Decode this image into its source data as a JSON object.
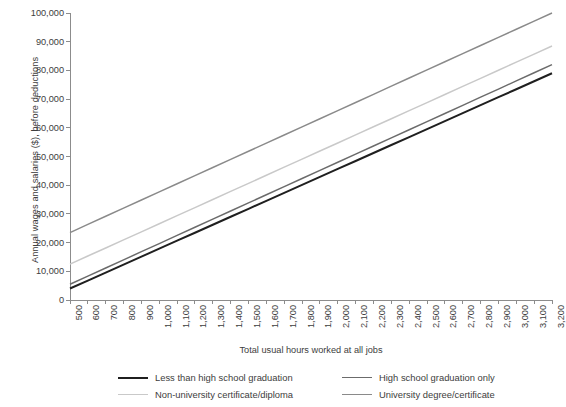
{
  "chart_data": {
    "type": "line",
    "title": "",
    "xlabel": "Total usual hours worked at all jobs",
    "ylabel": "Annual wages and salaries ($), before deductions",
    "xlim": [
      500,
      3200
    ],
    "ylim": [
      0,
      100000
    ],
    "grid": false,
    "legend_position": "bottom",
    "x": [
      500,
      600,
      700,
      800,
      900,
      1000,
      1100,
      1200,
      1300,
      1400,
      1500,
      1600,
      1700,
      1800,
      1900,
      2000,
      2100,
      2200,
      2300,
      2400,
      2500,
      2600,
      2700,
      2800,
      2900,
      3000,
      3100,
      3200
    ],
    "xtick_labels": [
      "500",
      "600",
      "700",
      "800",
      "900",
      "1,000",
      "1,100",
      "1,200",
      "1,300",
      "1,400",
      "1,500",
      "1,600",
      "1,700",
      "1,800",
      "1,900",
      "2,000",
      "2,100",
      "2,200",
      "2,300",
      "2,400",
      "2,500",
      "2,600",
      "2,700",
      "2,800",
      "2,900",
      "3,000",
      "3,100",
      "3,200"
    ],
    "ytick_values": [
      0,
      10000,
      20000,
      30000,
      40000,
      50000,
      60000,
      70000,
      80000,
      90000,
      100000
    ],
    "ytick_labels": [
      "0",
      "10,000",
      "20,000",
      "30,000",
      "40,000",
      "50,000",
      "60,000",
      "70,000",
      "80,000",
      "90,000",
      "100,000"
    ],
    "series": [
      {
        "name": "Less than high school graduation",
        "color": "#1f1f1f",
        "values": [
          4000,
          6778,
          9556,
          12333,
          15111,
          17889,
          20667,
          23444,
          26222,
          29000,
          31778,
          34556,
          37333,
          40111,
          42889,
          45667,
          48444,
          51222,
          54000,
          56778,
          59556,
          62333,
          65111,
          67889,
          70667,
          73444,
          76222,
          79000
        ]
      },
      {
        "name": "High school graduation only",
        "color": "#6b6b6b",
        "values": [
          5500,
          8333,
          11167,
          14000,
          16833,
          19667,
          22500,
          25333,
          28167,
          31000,
          33833,
          36667,
          39500,
          42333,
          45167,
          48000,
          50833,
          53667,
          56500,
          59333,
          62167,
          65000,
          67833,
          70667,
          73500,
          76333,
          79167,
          82000
        ]
      },
      {
        "name": "Non-university certificate/diploma",
        "color": "#c9c9c9",
        "values": [
          12500,
          15315,
          18130,
          20944,
          23759,
          26574,
          29389,
          32204,
          35019,
          37833,
          40648,
          43463,
          46278,
          49093,
          51907,
          54722,
          57537,
          60352,
          63167,
          65981,
          68796,
          71611,
          74426,
          77241,
          80056,
          82870,
          85685,
          88500
        ]
      },
      {
        "name": "University degree/certificate",
        "color": "#8a8a8a",
        "values": [
          23500,
          26333,
          29167,
          32000,
          34833,
          37667,
          40500,
          43333,
          46167,
          49000,
          51833,
          54667,
          57500,
          60333,
          63167,
          66000,
          68833,
          71667,
          74500,
          77333,
          80167,
          83000,
          85833,
          88667,
          91500,
          94333,
          97167,
          100000
        ]
      }
    ]
  },
  "axis": {
    "line_color": "#8c8c8c",
    "tick_color": "#8c8c8c"
  },
  "legend": {
    "items": [
      {
        "label": "Less than high school graduation",
        "color": "#1f1f1f",
        "width": "2.4px"
      },
      {
        "label": "High school graduation only",
        "color": "#6b6b6b",
        "width": "1.6px"
      },
      {
        "label": "Non-university certificate/diploma",
        "color": "#c9c9c9",
        "width": "1.6px"
      },
      {
        "label": "University degree/certificate",
        "color": "#8a8a8a",
        "width": "1.6px"
      }
    ]
  }
}
